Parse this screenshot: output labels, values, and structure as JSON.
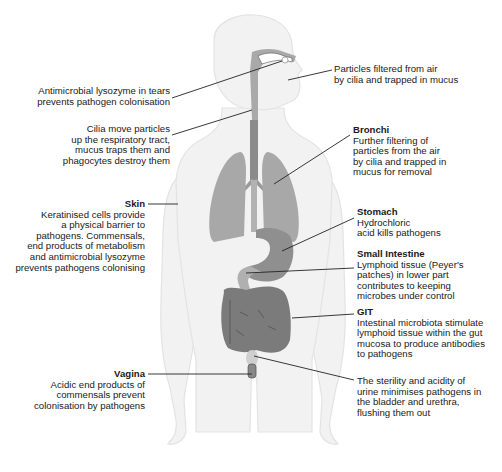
{
  "diagram": {
    "type": "anatomical-diagram",
    "colors": {
      "body_fill": "#f1f1f1",
      "body_outline": "#e2e2e2",
      "organ_light": "#a6a6a6",
      "organ_mid": "#8f8f8f",
      "organ_dark": "#777777",
      "leader_line": "#222222",
      "text": "#1a1a1a"
    },
    "labels": {
      "tears": {
        "title": "",
        "lines": [
          "Antimicrobial lysozyme in tears",
          "prevents pathogen colonisation"
        ]
      },
      "nose": {
        "title": "",
        "lines": [
          "Particles filtered from air",
          "by cilia and trapped in mucus"
        ]
      },
      "trachea": {
        "title": "",
        "lines": [
          "Cilia move particles",
          "up the respiratory tract,",
          "mucus traps them and",
          "phagocytes destroy them"
        ]
      },
      "bronchi": {
        "title": "Bronchi",
        "lines": [
          "Further filtering of",
          "particles from the air",
          "by cilia and trapped in",
          "mucus for removal"
        ]
      },
      "skin": {
        "title": "Skin",
        "lines": [
          "Keratinised cells provide",
          "a physical barrier to",
          "pathogens. Commensals,",
          "end products of metabolism",
          "and antimicrobial lysozyme",
          "prevents pathogens colonising"
        ]
      },
      "stomach": {
        "title": "Stomach",
        "lines": [
          "Hydrochloric",
          "acid kills pathogens"
        ]
      },
      "small_intestine": {
        "title": "Small Intestine",
        "lines": [
          "Lymphoid tissue (Peyer's",
          "patches) in lower part",
          "contributes to keeping",
          "microbes under control"
        ]
      },
      "git": {
        "title": "GIT",
        "lines": [
          "Intestinal microbiota stimulate",
          "lymphoid tissue within the gut",
          "mucosa to produce antibodies",
          "to pathogens"
        ]
      },
      "vagina": {
        "title": "Vagina",
        "lines": [
          "Acidic end products of",
          "commensals prevent",
          "colonisation by pathogens"
        ]
      },
      "urinary": {
        "title": "",
        "lines": [
          "The sterility and acidity of",
          "urine minimises pathogens in",
          "the bladder and urethra,",
          "flushing them out"
        ]
      }
    }
  }
}
